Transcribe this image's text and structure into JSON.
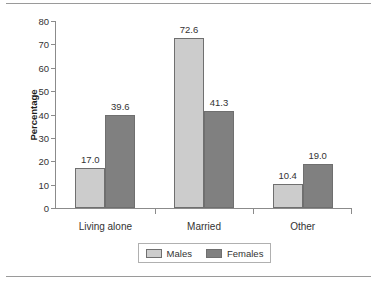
{
  "chart_data": {
    "type": "bar",
    "title": "",
    "xlabel": "",
    "ylabel": "Percentage",
    "categories": [
      "Living alone",
      "Married",
      "Other"
    ],
    "series": [
      {
        "name": "Males",
        "values": [
          17.0,
          72.6,
          10.4
        ],
        "color": "#cccccc"
      },
      {
        "name": "Females",
        "values": [
          39.6,
          41.3,
          19.0
        ],
        "color": "#808080"
      }
    ],
    "value_labels": [
      [
        "17.0",
        "39.6"
      ],
      [
        "72.6",
        "41.3"
      ],
      [
        "10.4",
        "19.0"
      ]
    ],
    "ylim": [
      0,
      80
    ],
    "yticks": [
      0,
      10,
      20,
      30,
      40,
      50,
      60,
      70,
      80
    ],
    "ytick_labels": [
      "0",
      "10",
      "20",
      "30",
      "40",
      "50",
      "60",
      "70",
      "80"
    ],
    "grid": false,
    "legend_position": "bottom-center"
  },
  "axis": {
    "y_title": "Percentage"
  },
  "legend": {
    "entries": [
      {
        "label": "Males"
      },
      {
        "label": "Females"
      }
    ]
  }
}
